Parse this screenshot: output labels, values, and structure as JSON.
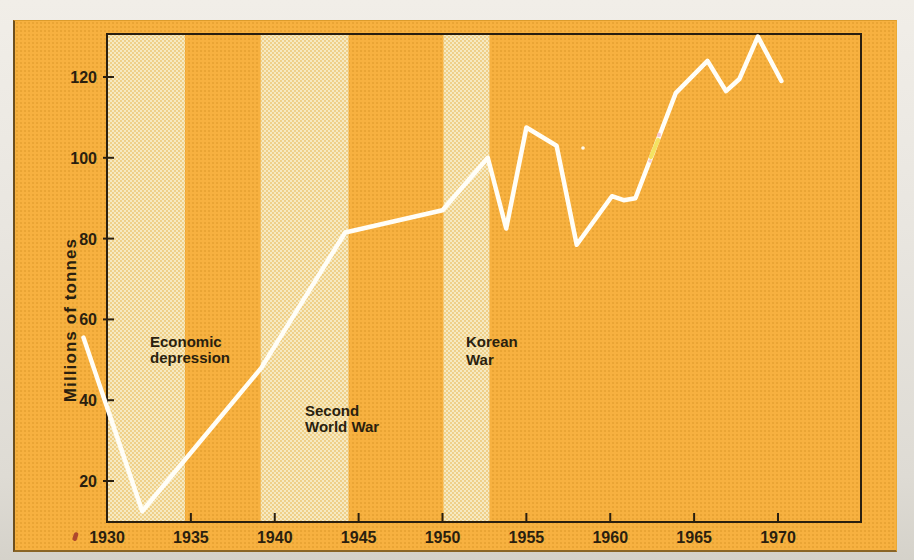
{
  "figure_type": "scanned textbook line chart",
  "colors": {
    "card_background": "#f7b140",
    "shaded_band": "#f3e2ab",
    "axis_ink": "#2a1f0f",
    "data_line": "#fffef8",
    "page_paper": "#e9e6e0"
  },
  "chart_data": {
    "type": "line",
    "title": "",
    "xlabel": "",
    "ylabel": "Millions of tonnes",
    "x_ticks": [
      1930,
      1935,
      1940,
      1945,
      1950,
      1955,
      1960,
      1965,
      1970
    ],
    "y_ticks": [
      20,
      40,
      60,
      80,
      100,
      120
    ],
    "x_range": [
      1928.5,
      1975
    ],
    "y_range": [
      10,
      130
    ],
    "grid": false,
    "legend": "none",
    "line_color": "#ffffff",
    "points": [
      {
        "year": 1928.6,
        "value": 55.5
      },
      {
        "year": 1932.1,
        "value": 12.5
      },
      {
        "year": 1939.2,
        "value": 48
      },
      {
        "year": 1944.2,
        "value": 81.5
      },
      {
        "year": 1950.0,
        "value": 87
      },
      {
        "year": 1952.7,
        "value": 100
      },
      {
        "year": 1953.8,
        "value": 82.5
      },
      {
        "year": 1955.0,
        "value": 107.5
      },
      {
        "year": 1956.8,
        "value": 103
      },
      {
        "year": 1958.0,
        "value": 78.5
      },
      {
        "year": 1960.1,
        "value": 90.5
      },
      {
        "year": 1960.8,
        "value": 89.5
      },
      {
        "year": 1961.5,
        "value": 90
      },
      {
        "year": 1963.9,
        "value": 116
      },
      {
        "year": 1965.8,
        "value": 124
      },
      {
        "year": 1966.9,
        "value": 116.5
      },
      {
        "year": 1967.7,
        "value": 119.5
      },
      {
        "year": 1968.8,
        "value": 130
      },
      {
        "year": 1970.2,
        "value": 119
      }
    ],
    "annotations": [
      {
        "label": "Economic depression",
        "lines": [
          "Economic",
          "depression"
        ],
        "year_start": 1930.0,
        "year_end": 1934.65
      },
      {
        "label": "Second World War",
        "lines": [
          "Second",
          "World War"
        ],
        "year_start": 1939.1,
        "year_end": 1944.4
      },
      {
        "label": "Korean War",
        "lines": [
          "Korean",
          "War"
        ],
        "year_start": 1950.0,
        "year_end": 1952.8
      }
    ]
  }
}
